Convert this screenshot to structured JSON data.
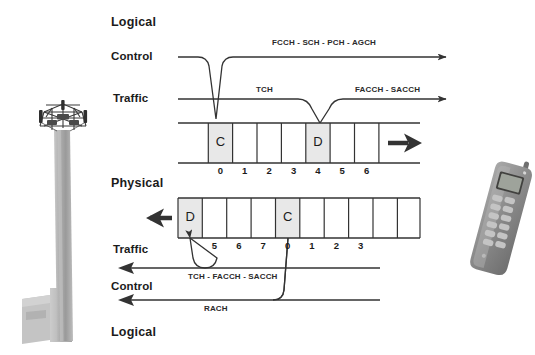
{
  "diagram": {
    "background_color": "#ffffff",
    "line_color": "#333333",
    "cell_fill_color": "#e8e8e8",
    "text_color": "#1b1b1b"
  },
  "downlink": {
    "section_label": "Logical",
    "control_row_label": "Control",
    "traffic_row_label": "Traffic",
    "control_channels_label": "FCCH - SCH - PCH - AGCH",
    "traffic_channel_label": "TCH",
    "traffic_assoc_channels_label": "FACCH - SACCH",
    "frame": {
      "direction": "right",
      "slots": [
        {
          "number": "0",
          "content": "C",
          "highlighted": true
        },
        {
          "number": "1",
          "content": "",
          "highlighted": false
        },
        {
          "number": "2",
          "content": "",
          "highlighted": false
        },
        {
          "number": "3",
          "content": "",
          "highlighted": false
        },
        {
          "number": "4",
          "content": "D",
          "highlighted": true
        },
        {
          "number": "5",
          "content": "",
          "highlighted": false
        },
        {
          "number": "6",
          "content": "",
          "highlighted": false
        }
      ]
    }
  },
  "uplink": {
    "section_label": "Physical",
    "bottom_section_label": "Logical",
    "traffic_row_label": "Traffic",
    "control_row_label": "Control",
    "traffic_channels_label": "TCH - FACCH - SACCH",
    "control_channel_label": "RACH",
    "frame": {
      "direction": "left",
      "slots": [
        {
          "number": "",
          "content": "D",
          "highlighted": true
        },
        {
          "number": "5",
          "content": "",
          "highlighted": false
        },
        {
          "number": "6",
          "content": "",
          "highlighted": false
        },
        {
          "number": "7",
          "content": "",
          "highlighted": false
        },
        {
          "number": "0",
          "content": "C",
          "highlighted": true
        },
        {
          "number": "1",
          "content": "",
          "highlighted": false
        },
        {
          "number": "2",
          "content": "",
          "highlighted": false
        },
        {
          "number": "3",
          "content": "",
          "highlighted": false
        }
      ]
    }
  },
  "images": {
    "base_station": "cell-tower-photo",
    "mobile_station": "mobile-phone-photo"
  }
}
